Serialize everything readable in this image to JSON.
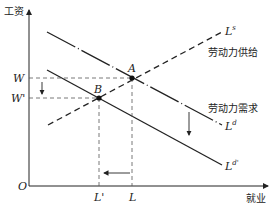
{
  "axes": {
    "y_label": "工资",
    "x_label": "就业",
    "origin": "O"
  },
  "curves": {
    "supply": {
      "label": "L",
      "sup": "s",
      "name": "劳动力供给"
    },
    "demand": {
      "label": "L",
      "sup": "d",
      "name": "劳动力需求"
    },
    "demand_shifted": {
      "label": "L",
      "sup": "d'"
    }
  },
  "points": {
    "A": "A",
    "B": "B"
  },
  "ticks": {
    "W": "W",
    "W_prime": "W'",
    "L": "L",
    "L_prime": "L'"
  },
  "colors": {
    "line": "#222222",
    "dash": "#555555",
    "background": "#ffffff"
  }
}
